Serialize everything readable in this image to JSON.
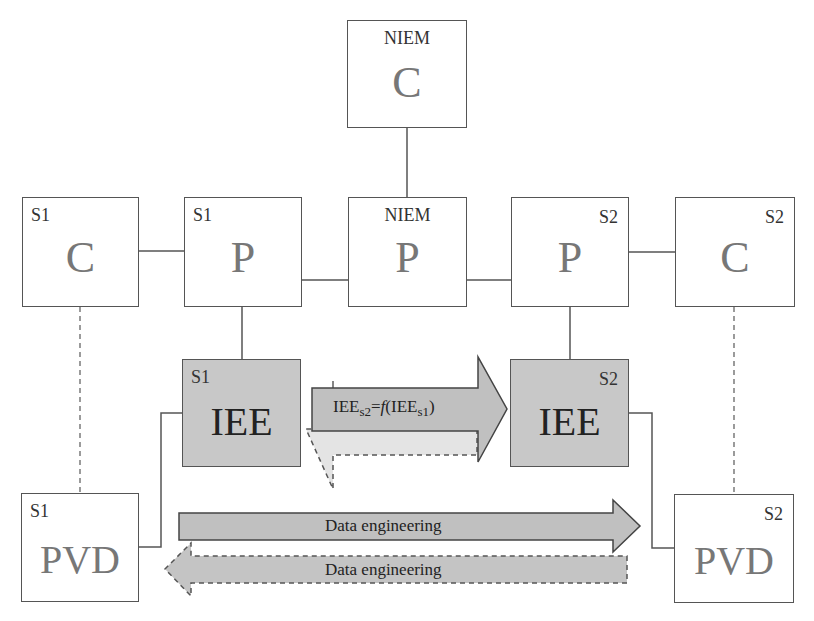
{
  "diagram": {
    "colors": {
      "box_border": "#555555",
      "shaded_fill": "#c8c8c8",
      "arrow_fill": "#c0c0c0",
      "big_letter": "#777777"
    },
    "boxes": {
      "niem_c": {
        "tag": "NIEM",
        "label": "C"
      },
      "s1_c": {
        "tag": "S1",
        "label": "C"
      },
      "s1_p": {
        "tag": "S1",
        "label": "P"
      },
      "niem_p": {
        "tag": "NIEM",
        "label": "P"
      },
      "s2_p": {
        "tag": "S2",
        "label": "P"
      },
      "s2_c": {
        "tag": "S2",
        "label": "C"
      },
      "s1_iee": {
        "tag": "S1",
        "label": "IEE"
      },
      "s2_iee": {
        "tag": "S2",
        "label": "IEE"
      },
      "s1_pvd": {
        "tag": "S1",
        "label": "PVD"
      },
      "s2_pvd": {
        "tag": "S2",
        "label": "PVD"
      }
    },
    "arrows": {
      "iee_transform": {
        "lhs": "IEE",
        "lhs_sub": "s2",
        "eq": "=",
        "func": "f",
        "arg": "(IEE",
        "arg_sub": "s1",
        "close": ")"
      },
      "data_forward": {
        "label": "Data engineering"
      },
      "data_backward": {
        "label": "Data engineering"
      }
    }
  }
}
